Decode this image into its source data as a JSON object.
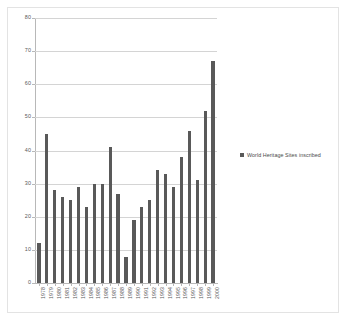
{
  "figure": {
    "background_color": "#ffffff",
    "frame_color": "#e3e3e3"
  },
  "legend": {
    "position": "right",
    "swatch_color": "#595959",
    "entries": [
      {
        "label": "World Heritage Sites inscribed",
        "color": "#595959"
      }
    ]
  },
  "axes": {
    "y_ticks": [
      "0",
      "10",
      "20",
      "30",
      "40",
      "50",
      "60",
      "70",
      "80"
    ],
    "x_ticks": [
      "1978",
      "1979",
      "1980",
      "1981",
      "1982",
      "1983",
      "1984",
      "1985",
      "1986",
      "1987",
      "1988",
      "1989",
      "1990",
      "1991",
      "1992",
      "1993",
      "1994",
      "1995",
      "1996",
      "1997",
      "1998",
      "1999",
      "2000"
    ]
  },
  "chart_data": {
    "type": "bar",
    "title": "",
    "subtitle": "",
    "xlabel": "",
    "ylabel": "",
    "ylim": [
      0,
      80
    ],
    "ytick_step": 10,
    "grid": true,
    "legend_position": "right",
    "bar_color": "#595959",
    "categories": [
      "1978",
      "1979",
      "1980",
      "1981",
      "1982",
      "1983",
      "1984",
      "1985",
      "1986",
      "1987",
      "1988",
      "1989",
      "1990",
      "1991",
      "1992",
      "1993",
      "1994",
      "1995",
      "1996",
      "1997",
      "1998",
      "1999",
      "2000"
    ],
    "series": [
      {
        "name": "World Heritage Sites inscribed",
        "color": "#595959",
        "values": [
          12,
          45,
          28,
          26,
          25,
          29,
          23,
          30,
          30,
          41,
          27,
          8,
          19,
          23,
          25,
          34,
          33,
          29,
          38,
          46,
          31,
          52,
          67
        ]
      }
    ],
    "values": [
      12,
      45,
      28,
      26,
      25,
      29,
      23,
      30,
      30,
      41,
      27,
      8,
      19,
      23,
      25,
      34,
      33,
      29,
      38,
      46,
      31,
      52,
      67
    ]
  }
}
